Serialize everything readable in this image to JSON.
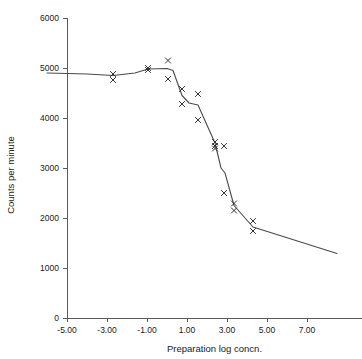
{
  "chart_data": {
    "type": "scatter",
    "title": "",
    "xlabel": "Preparation log concn.",
    "ylabel": "Counts per minute",
    "xlim": [
      -6.0,
      8.5
    ],
    "ylim": [
      0,
      6000
    ],
    "grid": false,
    "legend": "none",
    "xticks": [
      -5.0,
      -3.0,
      -1.0,
      1.0,
      3.0,
      5.0,
      7.0
    ],
    "xtick_labels": [
      "-5.00",
      "-3.00",
      "-1.00",
      "1.00",
      "3.00",
      "5.00",
      "7.00"
    ],
    "yticks": [
      0,
      1000,
      2000,
      3000,
      4000,
      5000,
      6000
    ],
    "ytick_labels": [
      "0",
      "1000",
      "2000",
      "3000",
      "4000",
      "5000",
      "6000"
    ],
    "marker_style": "x",
    "series": [
      {
        "name": "Observed counts",
        "type": "scatter",
        "points": [
          {
            "x": -2.7,
            "y": 4880
          },
          {
            "x": -2.7,
            "y": 4760
          },
          {
            "x": -0.95,
            "y": 5000
          },
          {
            "x": -0.95,
            "y": 4960
          },
          {
            "x": 0.05,
            "y": 5150
          },
          {
            "x": 0.05,
            "y": 4780
          },
          {
            "x": 0.75,
            "y": 4580
          },
          {
            "x": 0.75,
            "y": 4280
          },
          {
            "x": 1.55,
            "y": 4480
          },
          {
            "x": 1.55,
            "y": 3960
          },
          {
            "x": 2.4,
            "y": 3520
          },
          {
            "x": 2.4,
            "y": 3440
          },
          {
            "x": 2.4,
            "y": 3390
          },
          {
            "x": 2.85,
            "y": 3440
          },
          {
            "x": 2.85,
            "y": 2500
          },
          {
            "x": 3.35,
            "y": 2290
          },
          {
            "x": 3.35,
            "y": 2150
          },
          {
            "x": 4.3,
            "y": 1940
          },
          {
            "x": 4.3,
            "y": 1740
          }
        ]
      },
      {
        "name": "Fitted curve",
        "type": "line",
        "points": [
          {
            "x": -6.0,
            "y": 4900
          },
          {
            "x": -4.0,
            "y": 4880
          },
          {
            "x": -2.7,
            "y": 4850
          },
          {
            "x": -1.6,
            "y": 4900
          },
          {
            "x": -0.95,
            "y": 4980
          },
          {
            "x": 0.0,
            "y": 4990
          },
          {
            "x": 0.3,
            "y": 4950
          },
          {
            "x": 0.75,
            "y": 4450
          },
          {
            "x": 1.1,
            "y": 4300
          },
          {
            "x": 1.55,
            "y": 4260
          },
          {
            "x": 2.4,
            "y": 3500
          },
          {
            "x": 2.7,
            "y": 3000
          },
          {
            "x": 2.9,
            "y": 2900
          },
          {
            "x": 3.35,
            "y": 2250
          },
          {
            "x": 4.3,
            "y": 1820
          },
          {
            "x": 8.5,
            "y": 1290
          }
        ]
      }
    ]
  },
  "figure": {
    "top_fragment": ""
  }
}
